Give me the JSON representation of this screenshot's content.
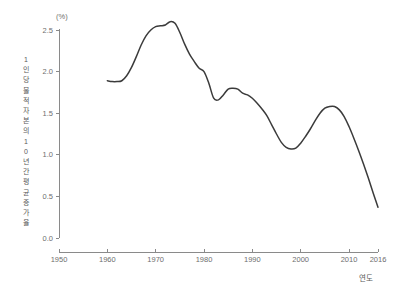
{
  "chart_data": {
    "type": "line",
    "title": "",
    "subtitle": "",
    "xlabel": "연도",
    "ylabel": "1인당 물적자본의 10년간 평균 증가율",
    "ylabel_chars": [
      "1",
      "인",
      "당",
      "물",
      "적",
      "자",
      "본",
      "의",
      "1",
      "0",
      "년",
      "간",
      "평",
      "균",
      "증",
      "가",
      "율"
    ],
    "yunit": "(%)",
    "xlim": [
      1950,
      2016
    ],
    "ylim": [
      0.0,
      2.5
    ],
    "grid": false,
    "legend": "none",
    "xticks": [
      1950,
      1960,
      1970,
      1980,
      1990,
      2000,
      2010,
      2016
    ],
    "xtick_labels": [
      "1950",
      "1960",
      "1970",
      "1980",
      "1990",
      "2000",
      "2010",
      "2016"
    ],
    "yticks": [
      0.0,
      0.5,
      1.0,
      1.5,
      2.0,
      2.5
    ],
    "ytick_labels": [
      "0.0",
      "0.5",
      "1.0",
      "1.5",
      "2.0",
      "2.5"
    ],
    "line_color": "#3b3b3b",
    "axis_color": "#8a8a8a",
    "series": [
      {
        "name": "1인당 물적자본의 10년간 평균 증가율",
        "x": [
          1960,
          1961,
          1962,
          1963,
          1964,
          1965,
          1966,
          1967,
          1968,
          1969,
          1970,
          1971,
          1972,
          1973,
          1974,
          1975,
          1976,
          1977,
          1978,
          1979,
          1980,
          1981,
          1982,
          1983,
          1984,
          1985,
          1986,
          1987,
          1988,
          1989,
          1990,
          1991,
          1992,
          1993,
          1994,
          1995,
          1996,
          1997,
          1998,
          1999,
          2000,
          2001,
          2002,
          2003,
          2004,
          2005,
          2006,
          2007,
          2008,
          2009,
          2010,
          2011,
          2012,
          2013,
          2014,
          2015,
          2016
        ],
        "values": [
          1.89,
          1.88,
          1.88,
          1.89,
          1.95,
          2.05,
          2.18,
          2.32,
          2.43,
          2.5,
          2.54,
          2.55,
          2.56,
          2.6,
          2.58,
          2.47,
          2.33,
          2.21,
          2.12,
          2.04,
          2.0,
          1.86,
          1.68,
          1.66,
          1.72,
          1.79,
          1.8,
          1.79,
          1.74,
          1.72,
          1.68,
          1.62,
          1.55,
          1.47,
          1.36,
          1.25,
          1.15,
          1.09,
          1.07,
          1.08,
          1.14,
          1.22,
          1.31,
          1.41,
          1.5,
          1.56,
          1.58,
          1.58,
          1.54,
          1.46,
          1.34,
          1.2,
          1.05,
          0.89,
          0.72,
          0.54,
          0.37
        ]
      }
    ]
  },
  "annotations": {
    "peak_value": "2.60",
    "peak_year": "1973",
    "trough_value": "1.07",
    "trough_year": "1998",
    "end_value": "0.37",
    "end_year": "2016"
  }
}
